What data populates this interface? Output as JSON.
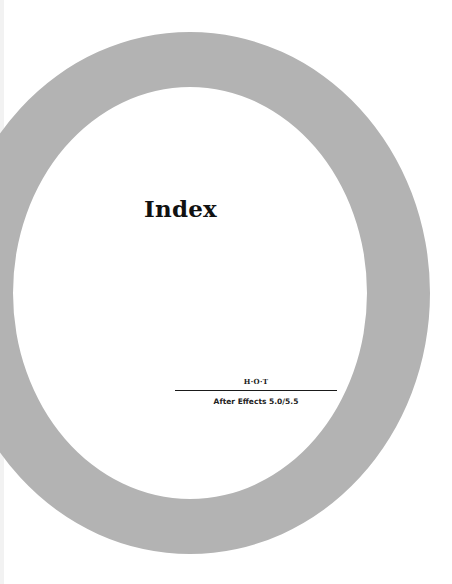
{
  "page": {
    "title": "Index",
    "series_mark": "H·O·T",
    "subtitle": "After Effects 5.0/5.5"
  },
  "decoration": {
    "ring_color": "#b3b3b3",
    "background_color": "#ffffff",
    "page_edge_color": "#f2f2f2",
    "rule_color": "#1a1a1a",
    "text_color": "#111111"
  }
}
